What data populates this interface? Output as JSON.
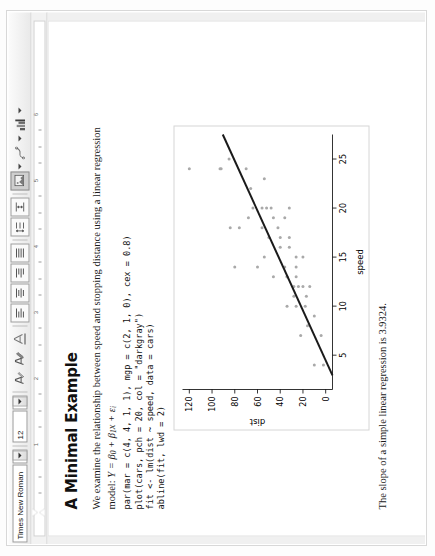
{
  "toolbar": {
    "font_name": "Times New Roman",
    "font_size": "12",
    "items": [
      {
        "name": "font-name-combo",
        "label": "Times New Roman",
        "icon": "font-name-dropdown"
      },
      {
        "name": "font-size-combo",
        "label": "12",
        "icon": "font-size-dropdown"
      },
      {
        "name": "text-color-button",
        "label": "",
        "icon": "text-color-icon"
      },
      {
        "name": "highlight-color-button",
        "label": "",
        "icon": "highlight-color-icon"
      },
      {
        "name": "shading-button",
        "label": "",
        "icon": "shading-icon"
      },
      {
        "name": "align-left-button",
        "label": "",
        "icon": "align-left-icon"
      },
      {
        "name": "align-center-button",
        "label": "",
        "icon": "align-center-icon"
      },
      {
        "name": "align-right-button",
        "label": "",
        "icon": "align-right-icon"
      },
      {
        "name": "align-justify-button",
        "label": "",
        "icon": "align-justify-icon"
      },
      {
        "name": "line-spacing-button",
        "label": "",
        "icon": "line-spacing-icon"
      },
      {
        "name": "paragraph-spacing-button",
        "label": "",
        "icon": "paragraph-spacing-icon"
      },
      {
        "name": "insert-image-button",
        "label": "",
        "icon": "insert-image-icon"
      },
      {
        "name": "insert-shape-button",
        "label": "",
        "icon": "insert-shape-icon"
      },
      {
        "name": "insert-chart-button",
        "label": "",
        "icon": "insert-chart-icon"
      }
    ]
  },
  "ruler": {
    "numbers": [
      "1",
      "2",
      "3",
      "4",
      "5",
      "6"
    ],
    "unit": "inch"
  },
  "document": {
    "heading": "A Minimal Example",
    "paragraph": "We examine the relationship between speed and stopping distance using a linear regression",
    "model_prefix": "model: ",
    "model_formula": "Y = β₀ + β₁x + εᵢ",
    "code": "par(mar = c(4, 4, 1, 1), mgp = c(2, 1, 0), cex = 0.8)\nplot(cars, pch = 20, col = \"darkgray\")\nfit <- lm(dist ~ speed, data = cars)\nabline(fit, lwd = 2)",
    "caption": "The slope of a simple linear regression is 3.9324."
  },
  "chart_data": {
    "type": "scatter",
    "title": "",
    "xlabel": "speed",
    "ylabel": "dist",
    "xlim": [
      1.5,
      27.5
    ],
    "ylim": [
      -6,
      126
    ],
    "xticks": [
      5,
      10,
      15,
      20,
      25
    ],
    "yticks": [
      0,
      20,
      40,
      60,
      80,
      100,
      120
    ],
    "grid": false,
    "point_color": "#a9a9a9",
    "line_color": "#1a1a1a",
    "legend": "none",
    "series": [
      {
        "name": "cars",
        "x": [
          4,
          4,
          7,
          7,
          8,
          9,
          10,
          10,
          10,
          11,
          11,
          12,
          12,
          12,
          12,
          13,
          13,
          13,
          13,
          14,
          14,
          14,
          14,
          15,
          15,
          15,
          16,
          16,
          17,
          17,
          17,
          18,
          18,
          18,
          18,
          19,
          19,
          19,
          20,
          20,
          20,
          20,
          20,
          22,
          23,
          24,
          24,
          24,
          24,
          25
        ],
        "y": [
          2,
          10,
          4,
          22,
          16,
          10,
          18,
          26,
          34,
          17,
          28,
          14,
          20,
          24,
          28,
          26,
          34,
          34,
          46,
          26,
          36,
          60,
          80,
          20,
          26,
          54,
          32,
          40,
          32,
          40,
          50,
          42,
          56,
          76,
          84,
          36,
          46,
          68,
          32,
          48,
          52,
          56,
          64,
          66,
          54,
          70,
          92,
          93,
          120,
          85
        ]
      }
    ],
    "fit_line": {
      "name": "abline(fit)",
      "intercept": -17.5791,
      "slope": 3.9324,
      "lwd": 2
    }
  }
}
